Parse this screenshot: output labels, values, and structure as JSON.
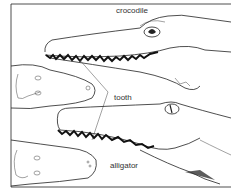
{
  "figure": {
    "labels": {
      "crocodile": "crocodile",
      "tooth": "tooth",
      "alligator": "alligator"
    },
    "colors": {
      "ink": "#222222",
      "background": "#ffffff"
    }
  }
}
